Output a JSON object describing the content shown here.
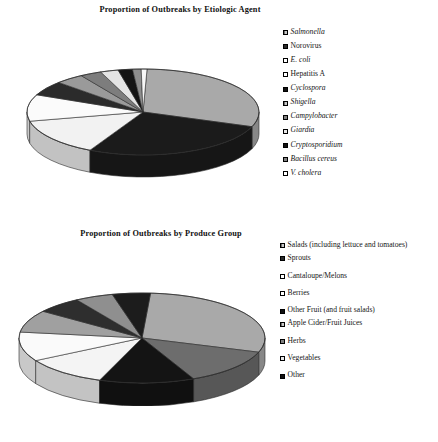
{
  "chart_data": [
    {
      "type": "pie",
      "title": "Proportion of Outbreaks by Etiologic Agent",
      "xlabel": "",
      "ylabel": "",
      "legend_position": "right",
      "grid": false,
      "categories": [
        "Salmonella",
        "Norovirus",
        "E. coli",
        "Hepatitis A",
        "Cyclospora",
        "Shigella",
        "Campylobacter",
        "Giardia",
        "Cryptosporidium",
        "Bacillus cereus",
        "V. cholera"
      ],
      "values": [
        30.0,
        27.0,
        14.0,
        10.0,
        5.5,
        4.0,
        3.0,
        2.5,
        2.0,
        1.2,
        0.8
      ],
      "colors": [
        "#a9a9a9",
        "#1b1b1b",
        "#f2f2f2",
        "#fbfbfb",
        "#2b2b2b",
        "#9a9a9a",
        "#7d7d7d",
        "#e4e4e4",
        "#141414",
        "#8d8d8d",
        "#f7f7f7"
      ],
      "swatch_styles": [
        "hatch-gray",
        "solid-dark",
        "outline-white",
        "outline-white",
        "solid-black",
        "hatch-gray",
        "solid-gray",
        "outline-light",
        "solid-black",
        "solid-gray",
        "outline-white"
      ],
      "italic_labels": [
        true,
        false,
        true,
        false,
        true,
        true,
        true,
        true,
        true,
        true,
        true
      ]
    },
    {
      "type": "pie",
      "title": "Proportion of Outbreaks by Produce Group",
      "xlabel": "",
      "ylabel": "",
      "legend_position": "right",
      "grid": false,
      "categories": [
        "Salads (including lettuce and tomatoes)",
        "Sprouts",
        "Cantaloupe/Melons",
        "Berries",
        "Other Fruit (and fruit salads)",
        "Apple Cider/Fruit Juices",
        "Herbs",
        "Vegetables",
        "Other"
      ],
      "values": [
        29.0,
        13.0,
        12.5,
        11.0,
        10.5,
        8.0,
        6.0,
        5.0,
        5.0
      ],
      "colors": [
        "#a9a9a9",
        "#6d6d6d",
        "#141414",
        "#f4f4f4",
        "#fafafa",
        "#a0a0a0",
        "#2e2e2e",
        "#8f8f8f",
        "#1c1c1c"
      ],
      "swatch_styles": [
        "hatch-gray",
        "solid-dark",
        "outline-white",
        "outline-white",
        "solid-black",
        "hatch-gray",
        "solid-gray",
        "outline-light",
        "solid-black"
      ],
      "italic_labels": [
        false,
        false,
        false,
        false,
        false,
        false,
        false,
        false,
        false
      ]
    }
  ],
  "chart1": {
    "title": "Proportion of Outbreaks by Etiologic Agent",
    "legend": [
      {
        "label": "Salmonella"
      },
      {
        "label": "Norovirus"
      },
      {
        "label": "E. coli"
      },
      {
        "label": "Hepatitis A"
      },
      {
        "label": "Cyclospora"
      },
      {
        "label": "Shigella"
      },
      {
        "label": "Campylobacter"
      },
      {
        "label": "Giardia"
      },
      {
        "label": "Cryptosporidium"
      },
      {
        "label": "Bacillus cereus"
      },
      {
        "label": "V. cholera"
      }
    ]
  },
  "chart2": {
    "title": "Proportion of Outbreaks by Produce Group",
    "legend": [
      {
        "label": "Salads (including lettuce and tomatoes)"
      },
      {
        "label": "Sprouts"
      },
      {
        "label": "Cantaloupe/Melons"
      },
      {
        "label": "Berries"
      },
      {
        "label": "Other Fruit (and fruit salads)"
      },
      {
        "label": "Apple Cider/Fruit Juices"
      },
      {
        "label": "Herbs"
      },
      {
        "label": "Vegetables"
      },
      {
        "label": "Other"
      }
    ]
  },
  "footnote": {
    "text": ""
  }
}
